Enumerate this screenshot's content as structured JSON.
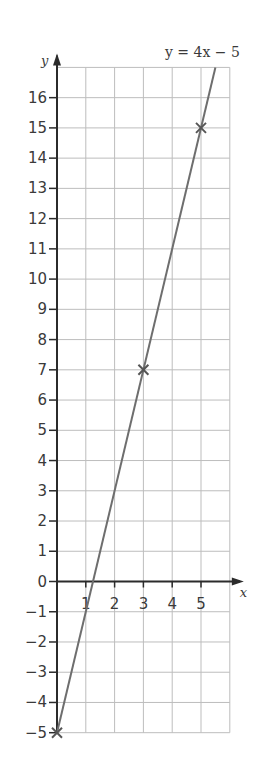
{
  "chart_data": {
    "type": "line",
    "title": "",
    "equation_label": "y = 4x − 5",
    "xlabel": "x",
    "ylabel": "y",
    "xlim": [
      0,
      6
    ],
    "ylim": [
      -5,
      17
    ],
    "grid": true,
    "x_ticks": [
      1,
      2,
      3,
      4,
      5
    ],
    "y_ticks": [
      16,
      15,
      14,
      13,
      12,
      11,
      10,
      9,
      8,
      7,
      6,
      5,
      4,
      3,
      2,
      1,
      0,
      -1,
      -2,
      -3,
      -4,
      -5
    ],
    "series": [
      {
        "name": "y = 4x − 5",
        "line": {
          "slope": 4,
          "intercept": -5,
          "x_start": 0,
          "x_end": 5.5
        },
        "marked_points": [
          {
            "x": 0,
            "y": -5
          },
          {
            "x": 3,
            "y": 7
          },
          {
            "x": 5,
            "y": 15
          }
        ]
      }
    ],
    "colors": {
      "grid": "#bdbdbd",
      "axis": "#2b2b2b",
      "line": "#6e6e6e",
      "marker": "#555555"
    }
  }
}
